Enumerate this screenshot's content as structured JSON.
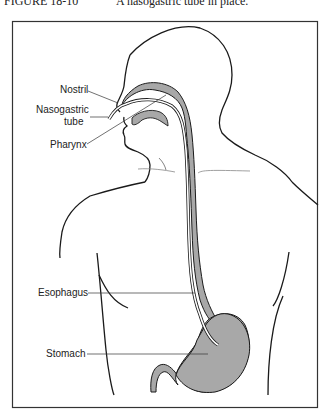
{
  "caption": {
    "figure_number": "FIGURE 18-10",
    "text": "A nasogastric tube in place."
  },
  "diagram": {
    "type": "anatomical illustration",
    "subject": "Nasogastric tube in place",
    "labels": [
      {
        "id": "nostril",
        "text": "Nostril"
      },
      {
        "id": "ng-tube-1",
        "text": "Nasogastric"
      },
      {
        "id": "ng-tube-2",
        "text": "tube"
      },
      {
        "id": "pharynx",
        "text": "Pharynx"
      },
      {
        "id": "esophagus",
        "text": "Esophagus"
      },
      {
        "id": "stomach",
        "text": "Stomach"
      }
    ],
    "colors": {
      "outline": "#1a1a1a",
      "organ_fill": "#a8a8a8",
      "tube": "#ffffff",
      "frame": "#333333"
    }
  }
}
